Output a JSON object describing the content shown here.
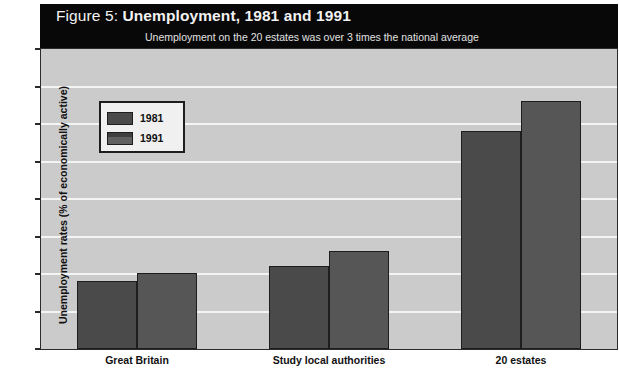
{
  "figure": {
    "title_prefix": "Figure 5: ",
    "title_main": "Unemployment, 1981 and 1991",
    "subtitle": "Unemployment on the 20 estates was over 3 times the national average"
  },
  "legend": {
    "items": [
      {
        "label": "1981",
        "color": "#4a4a4a"
      },
      {
        "label": "1991",
        "color": "#565656"
      }
    ]
  },
  "colors": {
    "title_bar": "#080808",
    "plot_background": "#cbcbcb",
    "gridline": "#f4f4f4",
    "axis": "#2b2b2b",
    "series_1981": "#4a4a4a",
    "series_1991": "#565656"
  },
  "chart_data": {
    "type": "bar",
    "title": "Figure 5: Unemployment, 1981 and 1991",
    "subtitle": "Unemployment on the 20 estates was over 3 times the national average",
    "xlabel": "",
    "ylabel": "Unemployment rates (% of economically active)",
    "categories": [
      "Great Britain",
      "Study local authorities",
      "20 estates"
    ],
    "series": [
      {
        "name": "1981",
        "values": [
          9,
          11,
          29
        ]
      },
      {
        "name": "1991",
        "values": [
          10,
          13,
          33
        ]
      }
    ],
    "ylim": [
      0,
      40
    ],
    "yticks": [
      0,
      5,
      10,
      15,
      20,
      25,
      30,
      35,
      40
    ],
    "ytick_labels": [
      "0",
      "5",
      "10",
      "15",
      "20",
      "25",
      "30",
      "35",
      "40"
    ],
    "grid": true,
    "grid_axis": "y",
    "legend_position": "upper-left-inside"
  }
}
